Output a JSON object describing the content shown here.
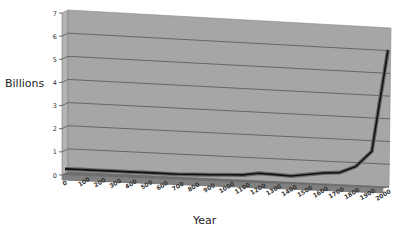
{
  "chart_data": {
    "type": "line",
    "title": "",
    "xlabel": "Year",
    "ylabel": "Billions",
    "ylim": [
      0,
      7
    ],
    "yticks": [
      0,
      1,
      2,
      3,
      4,
      5,
      6,
      7
    ],
    "grid": true,
    "legend": "none",
    "style": "3d-line",
    "categories": [
      "0",
      "100",
      "200",
      "300",
      "400",
      "500",
      "600",
      "700",
      "800",
      "900",
      "1000",
      "1100",
      "1200",
      "1300",
      "1400",
      "1500",
      "1600",
      "1700",
      "1800",
      "1900",
      "2000"
    ],
    "series": [
      {
        "name": "Population",
        "values": [
          0.2,
          0.2,
          0.2,
          0.2,
          0.2,
          0.2,
          0.2,
          0.2,
          0.22,
          0.24,
          0.27,
          0.3,
          0.4,
          0.38,
          0.35,
          0.45,
          0.55,
          0.6,
          0.9,
          1.6,
          6.1
        ]
      }
    ],
    "colors": {
      "wall": "#a6a6a6",
      "floor": "#6e6e6e",
      "gridline": "#555555",
      "line": "#111111"
    }
  }
}
